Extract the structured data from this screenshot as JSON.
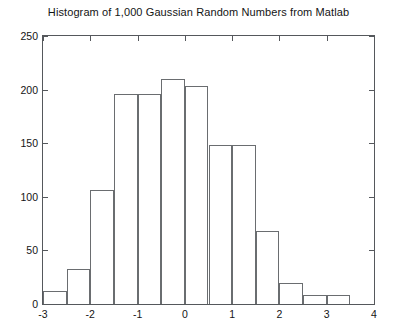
{
  "chart_data": {
    "type": "bar",
    "title": "Histogram of 1,000 Gaussian Random Numbers from Matlab",
    "xlabel": "",
    "ylabel": "",
    "xlim": [
      -3,
      4
    ],
    "ylim": [
      0,
      250
    ],
    "grid": false,
    "legend": null,
    "bin_width": 0.5,
    "bin_edges": [
      -3.0,
      -2.5,
      -2.0,
      -1.5,
      -1.0,
      -0.5,
      0.0,
      0.5,
      1.0,
      1.5,
      2.0,
      2.5,
      3.0,
      3.5
    ],
    "categories": [
      "-3.0 to -2.5",
      "-2.5 to -2.0",
      "-2.0 to -1.5",
      "-1.5 to -1.0",
      "-1.0 to -0.5",
      "-0.5 to 0.0",
      "0.0 to 0.5",
      "0.5 to 1.0",
      "1.0 to 1.5",
      "1.5 to 2.0",
      "2.0 to 2.5",
      "2.5 to 3.0",
      "3.0 to 3.5"
    ],
    "bin_centers": [
      -2.75,
      -2.25,
      -1.75,
      -1.25,
      -0.75,
      -0.25,
      0.25,
      0.75,
      1.25,
      1.75,
      2.25,
      2.75,
      3.25
    ],
    "values": [
      12,
      33,
      106,
      196,
      196,
      210,
      203,
      148,
      148,
      68,
      20,
      8,
      8
    ],
    "xticks": [
      -3,
      -2,
      -1,
      0,
      1,
      2,
      3,
      4
    ],
    "xtick_labels": [
      "-3",
      "-2",
      "-1",
      "0",
      "1",
      "2",
      "3",
      "4"
    ],
    "yticks": [
      0,
      50,
      100,
      150,
      200,
      250
    ],
    "ytick_labels": [
      "0",
      "50",
      "100",
      "150",
      "200",
      "250"
    ],
    "colors": {
      "bar_edge": "#6a6d70",
      "bar_fill": "transparent",
      "axis": "#55585c",
      "text": "#141414",
      "background": "#ffffff"
    }
  }
}
